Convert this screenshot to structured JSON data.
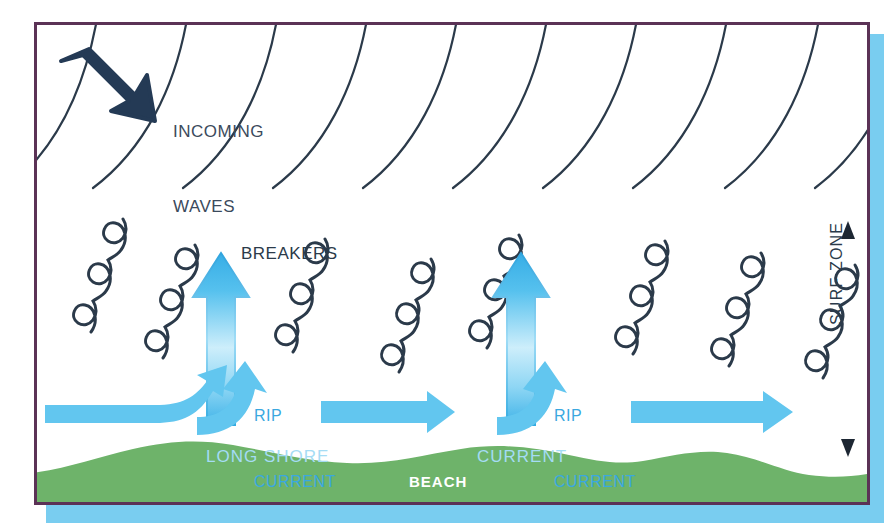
{
  "diagram": {
    "title_hidden": "",
    "labels": {
      "incoming_waves_line1": "INCOMING",
      "incoming_waves_line2": "WAVES",
      "breakers": "BREAKERS",
      "rip_current_line1": "RIP",
      "rip_current_line2": "CURRENT",
      "rip_current_2_line1": "RIP",
      "rip_current_2_line2": "CURRENT",
      "long_shore": "LONG SHORE",
      "current": "CURRENT",
      "beach": "BEACH",
      "surf_zone": "SURF ZONE"
    },
    "colors": {
      "frame_border": "#5b3256",
      "drop_shadow": "#79cdf0",
      "beach_green": "#6eb36a",
      "arrow_blue": "#62c6ef",
      "rip_arrow_top": "#3fb3e8",
      "wave_line": "#2b3a4a",
      "incoming_arrow": "#243a55",
      "label_blue": "#3aa8e0",
      "label_pale_blue": "#a5dcf5",
      "background": "#ffffff"
    },
    "counts": {
      "incoming_wave_arcs": 10,
      "breaker_groups": 8,
      "rip_currents": 2,
      "longshore_arrows": 3,
      "hook_arrows": 2,
      "surf_zone_markers": 2
    }
  }
}
